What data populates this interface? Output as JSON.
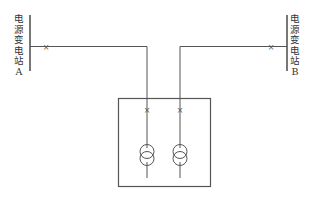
{
  "diagram": {
    "type": "single-line power diagram",
    "sources": [
      {
        "id": "A",
        "label_chars": [
          "电",
          "源",
          "变",
          "电",
          "站",
          "A"
        ],
        "label": "电源变电站A"
      },
      {
        "id": "B",
        "label_chars": [
          "电",
          "源",
          "变",
          "电",
          "站",
          "B"
        ],
        "label": "电源变电站B"
      }
    ],
    "breaker_symbol": "×",
    "substation": {
      "transformers": 2,
      "incoming_breakers": 2
    },
    "colors": {
      "line": "#555555",
      "background": "#ffffff"
    }
  }
}
